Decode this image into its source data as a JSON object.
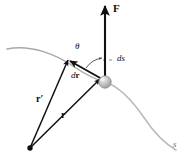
{
  "figure": {
    "background_color": "#ffffff",
    "width": 190,
    "height": 166
  },
  "labels": {
    "force": "F",
    "angle": "θ",
    "arc_element": "ds",
    "displacement_d": "d",
    "displacement_r": "r",
    "position_prime": "r′",
    "position": "r",
    "path_parameter": "s"
  },
  "colors": {
    "ink": "#111111",
    "path_curve": "#a8a8a8",
    "path_curve_right": "#b9b9b9",
    "particle_fill": "#b8b8b8",
    "particle_highlight": "#e8e8e8",
    "particle_stroke": "#8d8d8d",
    "leader_line": "#7a7a7a",
    "arc_stroke": "#4a4a4a",
    "s_label": "#6e6e6e"
  },
  "geometry": {
    "particle": {
      "x": 105,
      "y": 82,
      "r": 6
    },
    "origin": {
      "x": 30,
      "y": 148,
      "r": 2.6
    },
    "force_arrow": {
      "x1": 105,
      "y1": 78,
      "x2": 105,
      "y2": 4
    },
    "dr_arrow": {
      "x1": 103,
      "y1": 79,
      "x2": 69,
      "y2": 60
    },
    "r_prime_arrow": {
      "x1": 30,
      "y1": 148,
      "x2": 68,
      "y2": 60
    },
    "r_arrow": {
      "x1": 30,
      "y1": 148,
      "x2": 101,
      "y2": 79
    },
    "ds_leader": {
      "x1": 104,
      "y1": 60,
      "x2": 114,
      "y2": 60
    },
    "theta_arc": {
      "cx": 105,
      "cy": 82,
      "r": 24
    }
  },
  "label_positions": {
    "force": {
      "x": 113,
      "y": 4
    },
    "angle": {
      "x": 75,
      "y": 43
    },
    "arc_element": {
      "x": 117,
      "y": 54
    },
    "displacement": {
      "x": 71,
      "y": 71
    },
    "position_prime": {
      "x": 36,
      "y": 95
    },
    "position": {
      "x": 61,
      "y": 111
    },
    "path_parameter": {
      "x": 173,
      "y": 141
    }
  }
}
